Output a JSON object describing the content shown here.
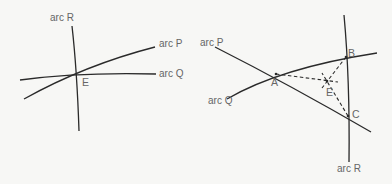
{
  "figure_left": {
    "arcs": [
      {
        "id": "R",
        "label": "arc R"
      },
      {
        "id": "P",
        "label": "arc P"
      },
      {
        "id": "Q",
        "label": "arc Q"
      }
    ],
    "points": [
      {
        "id": "E",
        "label": "E"
      }
    ]
  },
  "figure_right": {
    "arcs": [
      {
        "id": "P",
        "label": "arc P"
      },
      {
        "id": "Q",
        "label": "arc Q"
      },
      {
        "id": "R",
        "label": "arc R"
      }
    ],
    "points": [
      {
        "id": "A",
        "label": "A"
      },
      {
        "id": "B",
        "label": "B"
      },
      {
        "id": "C",
        "label": "C"
      },
      {
        "id": "E",
        "label": "E"
      }
    ]
  },
  "colors": {
    "line": "#2a2a2a",
    "label": "#666666",
    "background": "#f7f7f5"
  }
}
